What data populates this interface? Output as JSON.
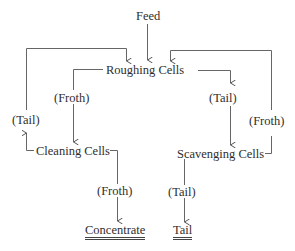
{
  "diagram": {
    "type": "flotation-circuit-flowsheet",
    "nodes": {
      "feed": "Feed",
      "roughing": "Roughing Cells",
      "cleaning": "Cleaning Cells",
      "scavenging": "Scavenging Cells",
      "concentrate": "Concentrate",
      "tail_final": "Tail"
    },
    "edge_labels": {
      "rougher_froth": "(Froth)",
      "rougher_tail": "(Tail)",
      "cleaner_tail": "(Tail)",
      "cleaner_froth": "(Froth)",
      "scavenger_froth": "(Froth)",
      "scavenger_tail": "(Tail)"
    },
    "edges": [
      {
        "from": "Feed",
        "to": "Roughing Cells"
      },
      {
        "from": "Roughing Cells",
        "to": "Cleaning Cells",
        "label": "(Froth)"
      },
      {
        "from": "Roughing Cells",
        "to": "Scavenging Cells",
        "label": "(Tail)"
      },
      {
        "from": "Cleaning Cells",
        "to": "Roughing Cells",
        "label": "(Tail)"
      },
      {
        "from": "Cleaning Cells",
        "to": "Concentrate",
        "label": "(Froth)"
      },
      {
        "from": "Scavenging Cells",
        "to": "Roughing Cells",
        "label": "(Froth)"
      },
      {
        "from": "Scavenging Cells",
        "to": "Tail",
        "label": "(Tail)"
      }
    ]
  }
}
